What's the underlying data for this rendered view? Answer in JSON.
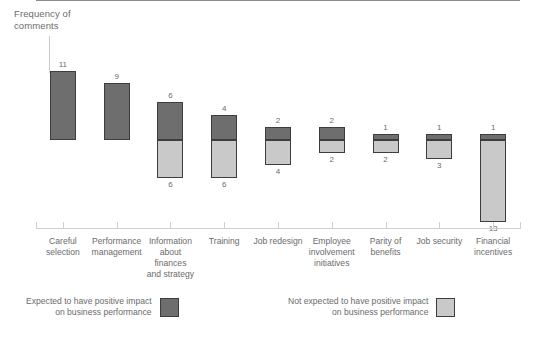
{
  "chart_data": {
    "type": "bar",
    "title": "",
    "subtitle": "",
    "xlabel": "",
    "ylabel": "Frequency of\ncomments",
    "grid": false,
    "legend_position": "bottom",
    "orientation": "vertical-diverging",
    "baseline_value": 0,
    "ylim": [
      -13,
      11
    ],
    "categories": [
      "Careful\nselection",
      "Performance\nmanagement",
      "Information\nabout finances\nand strategy",
      "Training",
      "Job redesign",
      "Employee\ninvolvement\ninitiatives",
      "Parity of\nbenefits",
      "Job security",
      "Financial\nincentives"
    ],
    "series": [
      {
        "name": "Expected to have positive impact on business performance",
        "color": "#6e6e6e",
        "values": [
          11,
          9,
          6,
          4,
          2,
          2,
          1,
          1,
          1
        ]
      },
      {
        "name": "Not expected to have positive impact on business performance",
        "color": "#c9c9c9",
        "values": [
          0,
          0,
          6,
          6,
          4,
          2,
          2,
          3,
          13
        ]
      }
    ],
    "positive_labels": [
      "11",
      "9",
      "6",
      "4",
      "2",
      "2",
      "1",
      "1",
      "1"
    ],
    "negative_labels": [
      "",
      "",
      "6",
      "6",
      "4",
      "2",
      "2",
      "3",
      "13"
    ]
  },
  "annotation": {
    "y_axis_note": "Frequency of\ncomments"
  },
  "legend": {
    "items": [
      {
        "label": "Expected to have positive impact\non business performance",
        "swatch": "dark-gray-swatch",
        "color": "#6e6e6e"
      },
      {
        "label": "Not expected to have positive impact\non business performance",
        "swatch": "light-gray-swatch",
        "color": "#c9c9c9"
      }
    ]
  },
  "colors": {
    "positive_bar": "#6e6e6e",
    "negative_bar": "#c9c9c9",
    "bar_outline": "#3d3d3d",
    "baseline": "#8c8c8c",
    "axis": "#cfcfcf",
    "text": "#6b6b6b",
    "background": "#ffffff"
  }
}
